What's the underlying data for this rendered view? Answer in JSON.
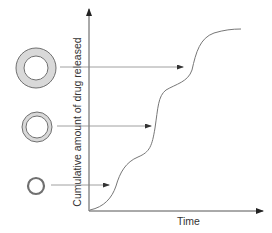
{
  "diagram": {
    "type": "drug-release-profile",
    "y_axis_label": "Cumulative amount of drug released",
    "x_axis_label": "Time",
    "colors": {
      "axis": "#555555",
      "curve": "#777777",
      "ring_stroke": "#707070",
      "ring_fill": "#d9d9d9",
      "arrow": "#888888"
    },
    "particles": [
      {
        "name": "thick-coating-particle",
        "description": "large ring, thick coating",
        "cx": 36,
        "cy": 68,
        "outer_r": 20,
        "inner_r": 12
      },
      {
        "name": "medium-coating-particle",
        "description": "medium ring, thin double coating",
        "cx": 37,
        "cy": 127,
        "outer_r": 15,
        "inner_r": 11
      },
      {
        "name": "thin-coating-particle",
        "description": "small ring, single thin wall",
        "cx": 36,
        "cy": 186,
        "outer_r": 9,
        "inner_r": 7
      }
    ],
    "curve_phases": [
      "first release burst (small particle)",
      "second release burst (medium particle)",
      "third release burst (large particle)"
    ]
  }
}
